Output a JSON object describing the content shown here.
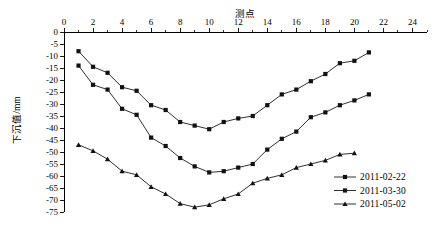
{
  "chart_data": {
    "type": "line",
    "title": "测点",
    "xlabel": "测点",
    "ylabel": "下沉值/mm",
    "x": [
      1,
      2,
      3,
      4,
      5,
      6,
      7,
      8,
      9,
      10,
      11,
      12,
      13,
      14,
      15,
      16,
      17,
      18,
      19,
      20,
      21
    ],
    "xlim": [
      0,
      25
    ],
    "ylim": [
      -75,
      0
    ],
    "x_ticks": [
      0,
      2,
      4,
      6,
      8,
      10,
      12,
      14,
      16,
      18,
      20,
      22,
      24
    ],
    "x_tick_labels": [
      "0",
      "2",
      "4",
      "6",
      "8",
      "10",
      "12",
      "14",
      "16",
      "18",
      "20",
      "22",
      "24"
    ],
    "y_ticks": [
      0,
      -5,
      -10,
      -15,
      -20,
      -25,
      -30,
      -35,
      -40,
      -45,
      -50,
      -55,
      -60,
      -65,
      -70,
      -75
    ],
    "y_tick_labels": [
      "0",
      "-5",
      "-10",
      "-15",
      "-20",
      "-25",
      "-30",
      "-35",
      "-40",
      "-45",
      "-50",
      "-55",
      "-60",
      "-65",
      "-70",
      "-75"
    ],
    "grid": false,
    "x_axis_position": "top",
    "legend_position": "bottom-right",
    "series": [
      {
        "name": "2011-02-22",
        "marker": "square",
        "color": "#1a1a1a",
        "values": [
          -8,
          -14.5,
          -17,
          -23,
          -24.5,
          -30.5,
          -32.5,
          -37.5,
          -39,
          -40.5,
          -37.5,
          -36,
          -35,
          -30.5,
          -26,
          -24,
          -20.5,
          -17.5,
          -13,
          -12,
          -8.5
        ]
      },
      {
        "name": "2011-03-30",
        "marker": "square",
        "color": "#1a1a1a",
        "values": [
          -14,
          -22,
          -24,
          -32,
          -34.5,
          -44,
          -47.5,
          -52.5,
          -56,
          -58.5,
          -58,
          -56.5,
          -55,
          -49,
          -44.5,
          -41.5,
          -35.5,
          -33.5,
          -30.5,
          -28.5,
          -26
        ]
      },
      {
        "name": "2011-05-02",
        "marker": "triangle",
        "color": "#1a1a1a",
        "values": [
          -47,
          -49.5,
          -53,
          -58,
          -59.5,
          -64.5,
          -67.5,
          -71.5,
          -73,
          -72,
          -69.5,
          -67.5,
          -63,
          -61,
          -59.5,
          -56.5,
          -55,
          -53.5,
          -51,
          -50.5,
          null
        ]
      }
    ]
  },
  "legend": {
    "items": [
      {
        "label": "2011-02-22"
      },
      {
        "label": "2011-03-30"
      },
      {
        "label": "2011-05-02"
      }
    ]
  }
}
